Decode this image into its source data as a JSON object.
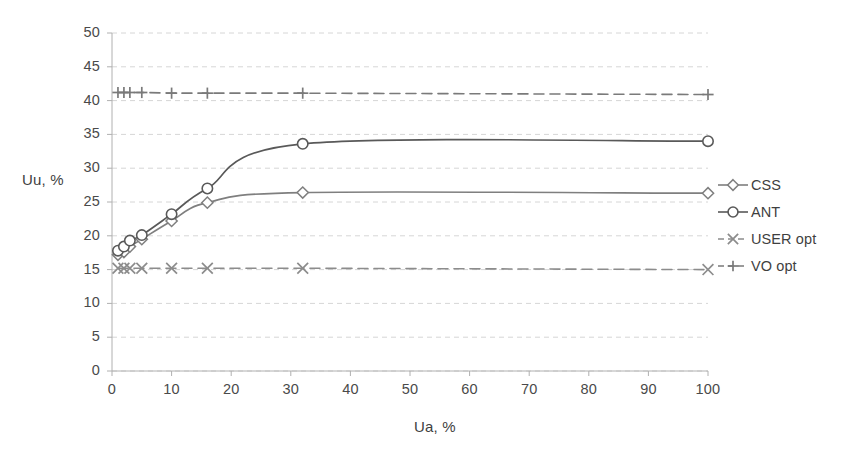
{
  "chart_data": {
    "type": "line",
    "title": "",
    "xlabel": "Ua, %",
    "ylabel": "Uu, %",
    "xlim": [
      0,
      100
    ],
    "ylim": [
      0,
      50
    ],
    "xticks": [
      0,
      10,
      20,
      30,
      40,
      50,
      60,
      70,
      80,
      90,
      100
    ],
    "yticks": [
      0,
      5,
      10,
      15,
      20,
      25,
      30,
      35,
      40,
      45,
      50
    ],
    "grid": "horizontal-dashed",
    "legend_position": "right",
    "x": [
      1,
      2,
      3,
      5,
      10,
      16,
      32,
      100
    ],
    "series": [
      {
        "name": "CSS",
        "marker": "diamond",
        "linestyle": "solid",
        "color": "#7f7f7f",
        "values": [
          17.2,
          17.6,
          18.4,
          19.5,
          22.2,
          24.9,
          26.4,
          26.3
        ]
      },
      {
        "name": "ANT",
        "marker": "circle",
        "linestyle": "solid",
        "color": "#595959",
        "values": [
          17.8,
          18.4,
          19.3,
          20.1,
          23.2,
          27.0,
          33.6,
          34.0
        ]
      },
      {
        "name": "USER opt",
        "marker": "x",
        "linestyle": "dashed",
        "color": "#8c8c8c",
        "values": [
          15.2,
          15.2,
          15.2,
          15.2,
          15.2,
          15.2,
          15.2,
          15.0
        ]
      },
      {
        "name": "VO opt",
        "marker": "plus",
        "linestyle": "dashed",
        "color": "#7a7a7a",
        "values": [
          41.2,
          41.2,
          41.2,
          41.2,
          41.1,
          41.1,
          41.1,
          40.9
        ]
      }
    ]
  },
  "legend": {
    "items": [
      {
        "label": "CSS"
      },
      {
        "label": "ANT"
      },
      {
        "label": "USER opt"
      },
      {
        "label": "VO opt"
      }
    ]
  },
  "colors": {
    "grid": "#d6d6d6",
    "axis": "#b0b0b0",
    "text": "#3f3f3f"
  }
}
